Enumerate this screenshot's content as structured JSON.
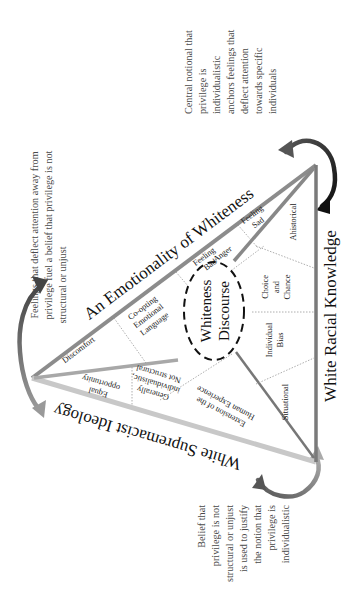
{
  "diagram": {
    "center": {
      "line1": "Whiteness",
      "line2": "Discourse"
    },
    "sides": {
      "emotionality": "An Emotionality of Whiteness",
      "ideology": "White Supremacist Ideology",
      "knowledge": "White Racial Knowledge"
    },
    "emotionality_cells": {
      "discomfort": "Discomfort",
      "coopting": [
        "Co-opting",
        "Emotional",
        "Language"
      ],
      "feeling_bad": [
        "Feeling",
        "Bad"
      ],
      "feeling_sad": [
        "Feeling",
        "Sad"
      ],
      "anger": "Anger"
    },
    "ideology_cells": {
      "equal": [
        "Equal",
        "opportunity"
      ],
      "generally": [
        "Generally",
        "individualistic,",
        "Not structural"
      ],
      "extension": [
        "Extension of the",
        "Human Experience"
      ]
    },
    "knowledge_cells": {
      "ahistorical": "Ahistorical",
      "choice": [
        "Choice",
        "and",
        "Chance"
      ],
      "bias": [
        "Individual",
        "Bias"
      ],
      "situational": "Situational"
    },
    "captions": {
      "left": [
        "Feelings that deflect attention away from",
        "privilege fuel a belief that privilege is not",
        "structural or unjust"
      ],
      "top_right": [
        "Central notional that",
        "privilege is",
        "individualistic",
        "anchors feelings that",
        "deflect attention",
        "towards specific",
        "individuals"
      ],
      "bottom_right": [
        "Belief that",
        "privilege is not",
        "structural or unjust",
        "is used to justify",
        "the notion that",
        "privilege is",
        "individualistic"
      ]
    },
    "colors": {
      "edge_emotionality": "#8c8c8c",
      "edge_ideology": "#c8c8c8",
      "edge_knowledge": "#7a7a7a",
      "arrow_dark": "#1a1a1a",
      "arrow_mid": "#6e6e6e",
      "caption_text": "#4a4a4a"
    }
  }
}
